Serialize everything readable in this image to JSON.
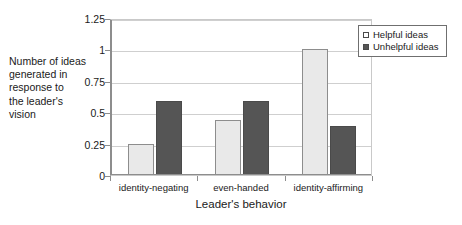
{
  "chart_data": {
    "type": "bar",
    "title": "",
    "xlabel": "Leader's behavior",
    "ylabel": "Number of ideas generated in response to the leader's vision",
    "ylabel_lines": [
      "Number of ideas",
      "generated in",
      "response to",
      "the leader's",
      "vision"
    ],
    "categories": [
      "identity-negating",
      "even-handed",
      "identity-affirming"
    ],
    "series": [
      {
        "name": "Helpful ideas",
        "values": [
          0.25,
          0.44,
          1.0
        ],
        "color": "#e9e9e9"
      },
      {
        "name": "Unhelpful ideas",
        "values": [
          0.59,
          0.59,
          0.39
        ],
        "color": "#555555"
      }
    ],
    "ylim": [
      0,
      1.25
    ],
    "ytick_values": [
      0,
      0.25,
      0.5,
      0.75,
      1,
      1.25
    ],
    "ytick_labels": [
      "0",
      "0.25",
      "0.5",
      "0.75",
      "1",
      "1.25"
    ],
    "grid": true,
    "legend_position": "top-right"
  },
  "legend": {
    "entries": [
      {
        "label": "Helpful ideas",
        "swatch": "light-square-swatch"
      },
      {
        "label": "Unhelpful ideas",
        "swatch": "dark-square-swatch"
      }
    ]
  }
}
